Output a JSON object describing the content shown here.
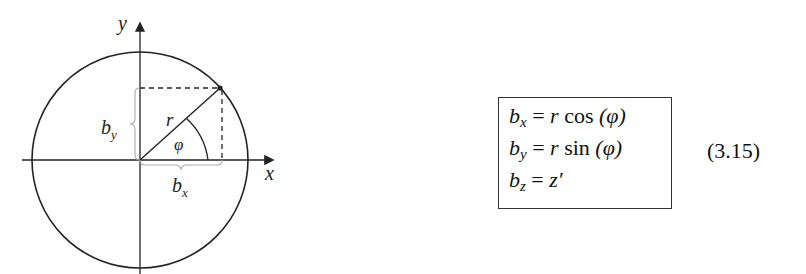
{
  "figure": {
    "axes": {
      "x_label": "x",
      "y_label": "y"
    },
    "labels": {
      "radius": "r",
      "angle": "φ",
      "bx": "b",
      "bx_sub": "x",
      "by": "b",
      "by_sub": "y"
    },
    "colors": {
      "stroke": "#222222",
      "brace": "#aaaaaa"
    }
  },
  "equations": {
    "lines": [
      {
        "lhs": "b",
        "sub": "x",
        "rhs_var": "r",
        "func": "cos",
        "arg": "(φ)"
      },
      {
        "lhs": "b",
        "sub": "y",
        "rhs_var": "r",
        "func": "sin",
        "arg": "(φ)"
      },
      {
        "lhs": "b",
        "sub": "z",
        "rhs": "z′"
      }
    ],
    "number": "(3.15)"
  }
}
